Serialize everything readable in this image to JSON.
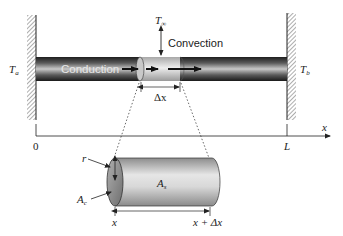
{
  "figure": {
    "labels": {
      "left_temp": "T",
      "left_temp_sub": "a",
      "right_temp": "T",
      "right_temp_sub": "b",
      "ambient_temp": "T",
      "ambient_temp_sub": "∞",
      "convection": "Convection",
      "conduction": "Conduction",
      "delta_x": "Δx",
      "axis_var": "x",
      "axis_origin": "0",
      "axis_end": "L",
      "radius": "r",
      "cross_section_area": "A",
      "cross_section_area_sub": "c",
      "surface_area": "A",
      "surface_area_sub": "s",
      "element_start": "x",
      "element_end": "x + Δx"
    },
    "colors": {
      "rod_dark": "#1e1e1e",
      "rod_mid": "#6a6a6a",
      "rod_highlight": "#d0d0d0",
      "element_light": "#cfcfcf",
      "cylinder_light": "#e4e4e4",
      "cylinder_dark": "#8a8a8a",
      "line": "#222222"
    }
  }
}
